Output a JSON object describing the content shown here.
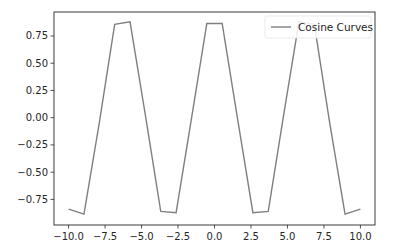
{
  "chart_data": {
    "type": "line",
    "title": "",
    "xlabel": "",
    "ylabel": "",
    "xlim": [
      -11.0,
      11.0
    ],
    "ylim": [
      -0.985,
      0.97
    ],
    "grid": false,
    "legend_position": "upper right",
    "x_ticks": [
      -10.0,
      -7.5,
      -5.0,
      -2.5,
      0.0,
      2.5,
      5.0,
      7.5,
      10.0
    ],
    "x_tick_labels": [
      "−10.0",
      "−7.5",
      "−5.0",
      "−2.5",
      "0.0",
      "2.5",
      "5.0",
      "7.5",
      "10.0"
    ],
    "y_ticks": [
      0.75,
      0.5,
      0.25,
      0.0,
      -0.25,
      -0.5,
      -0.75
    ],
    "y_tick_labels": [
      "0.75",
      "0.50",
      "0.25",
      "0.00",
      "−0.25",
      "−0.50",
      "−0.75"
    ],
    "series": [
      {
        "name": "Cosine Curves",
        "color": "#7f7f7f",
        "x": [
          -10.0,
          -8.947,
          -7.895,
          -6.842,
          -5.789,
          -4.737,
          -3.684,
          -2.632,
          -1.579,
          -0.526,
          0.526,
          1.579,
          2.632,
          3.684,
          4.737,
          5.789,
          6.842,
          7.895,
          8.947,
          10.0
        ],
        "values": [
          -0.839,
          -0.885,
          -0.048,
          0.856,
          0.879,
          0.024,
          -0.86,
          -0.872,
          -0.008,
          0.865,
          0.865,
          -0.008,
          -0.872,
          -0.86,
          0.024,
          0.879,
          0.856,
          -0.048,
          -0.885,
          -0.839
        ]
      }
    ]
  },
  "legend": {
    "label": "Cosine Curves"
  }
}
